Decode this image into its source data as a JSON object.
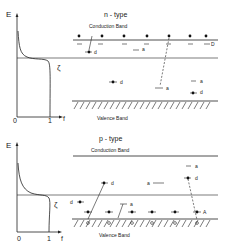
{
  "panels": [
    {
      "id": "n-type",
      "title": "n - type",
      "top_label": "Conduction  Band",
      "bottom_label": "Valence  Band",
      "axis": {
        "y_label": "E",
        "x_label": "f",
        "x_ticks": [
          "0",
          "1"
        ],
        "fermi_label": "ζ"
      },
      "level_label": "D",
      "markers": [
        {
          "type": "d",
          "label": "d"
        },
        {
          "type": "a",
          "label": "a"
        },
        {
          "type": "d",
          "label": "d"
        },
        {
          "type": "a",
          "label": "a"
        },
        {
          "type": "a",
          "label": "a"
        },
        {
          "type": "d",
          "label": "d"
        }
      ]
    },
    {
      "id": "p-type",
      "title": "p - type",
      "top_label": "Conduction  Band",
      "bottom_label": "Valence  Band",
      "axis": {
        "y_label": "E",
        "x_label": "f",
        "x_ticks": [
          "0",
          "1"
        ],
        "fermi_label": "ζ"
      },
      "level_label": "A",
      "markers": [
        {
          "type": "a",
          "label": "a"
        },
        {
          "type": "d",
          "label": "d"
        },
        {
          "type": "a",
          "label": "a"
        },
        {
          "type": "d",
          "label": "d"
        },
        {
          "type": "d",
          "label": "d"
        },
        {
          "type": "a",
          "label": "a"
        }
      ]
    }
  ]
}
